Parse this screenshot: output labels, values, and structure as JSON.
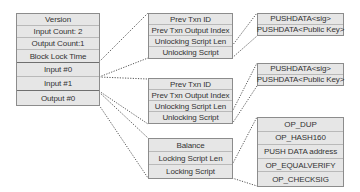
{
  "transaction": {
    "rows": [
      "Version",
      "Input Count: 2",
      "Output Count:1",
      "Block Lock Time",
      "Input #0",
      "Input #1",
      "Output #0"
    ]
  },
  "inputs": [
    {
      "rows": [
        "Prev Txn ID",
        "Prev Txn Output Index",
        "Unlocking Script Len",
        "Unlocking Script"
      ],
      "unlocking_script": [
        "PUSHDATA<sig>",
        "PUSHDATA<Public Key>"
      ]
    },
    {
      "rows": [
        "Prev Txn ID",
        "Prev Txn Output Index",
        "Unlocking Script Len",
        "Unlocking Script"
      ],
      "unlocking_script": [
        "PUSHDATA<sig>",
        "PUSHDATA<Public Key>"
      ]
    }
  ],
  "output": {
    "rows": [
      "Balance",
      "Locking Script Len",
      "Locking Script"
    ],
    "locking_script": [
      "OP_DUP",
      "OP_HASH160",
      "PUSH DATA address",
      "OP_EQUALVERIFY",
      "OP_CHECKSIG"
    ]
  },
  "colors": {
    "box_fill": "#e6e6e6",
    "box_border": "#8c8c8c",
    "text": "#333333",
    "connector": "#555555"
  }
}
